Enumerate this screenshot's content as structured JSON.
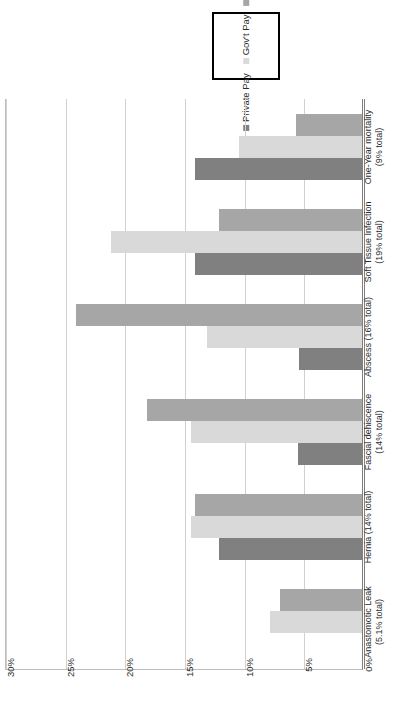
{
  "chart_data": {
    "type": "bar",
    "orientation": "horizontal",
    "title": "",
    "xlabel": "",
    "ylabel": "",
    "grid": true,
    "axis": {
      "ticks": [
        "30%",
        "25%",
        "20%",
        "15%",
        "10%",
        "5%",
        "0%"
      ],
      "tick_values": [
        30,
        25,
        20,
        15,
        10,
        5,
        0
      ],
      "min": 0,
      "max": 30,
      "direction": "right-to-left"
    },
    "legend": {
      "position": "top-right",
      "entries": [
        {
          "label": "Private Pay",
          "color": "#808080"
        },
        {
          "label": "Gov't Pay",
          "color": "#d9d9d9"
        },
        {
          "label": "Self Pay",
          "color": "#a6a6a6"
        }
      ]
    },
    "categories": [
      {
        "line1": "One-Year mortality",
        "line2": "(9% total)"
      },
      {
        "line1": "Soft Tissue Infection",
        "line2": "(19% total)"
      },
      {
        "line1": "Abscess (16% total)",
        "line2": ""
      },
      {
        "line1": "Fascial dehiscence",
        "line2": "(14% total)"
      },
      {
        "line1": "Hernia (14% total)",
        "line2": ""
      },
      {
        "line1": "Anastomotic Leak",
        "line2": "(5.1% total)"
      }
    ],
    "series": [
      {
        "name": "Private Pay",
        "color": "#808080",
        "values": [
          14.0,
          14.0,
          5.3,
          5.4,
          12.0,
          0
        ]
      },
      {
        "name": "Gov't Pay",
        "color": "#d9d9d9",
        "values": [
          10.3,
          21.0,
          13.0,
          14.3,
          14.3,
          7.7
        ]
      },
      {
        "name": "Self Pay",
        "color": "#a6a6a6",
        "values": [
          5.5,
          12.0,
          24.0,
          18.0,
          14.0,
          6.9
        ]
      }
    ]
  }
}
